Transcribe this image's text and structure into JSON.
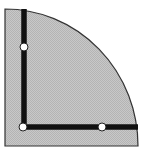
{
  "diagram": {
    "shape": "quarter-circle",
    "colors": {
      "fill": "#c4c4c4",
      "outline": "#333333",
      "bar": "#111111",
      "node_fill": "#ffffff",
      "background": "#ffffff"
    },
    "bars": [
      {
        "name": "vertical-bar",
        "x1": 24,
        "y1": 9,
        "x2": 24,
        "y2": 127
      },
      {
        "name": "horizontal-bar",
        "x1": 24,
        "y1": 127,
        "x2": 138,
        "y2": 127
      }
    ],
    "nodes": [
      {
        "name": "top-node",
        "cx": 24,
        "cy": 47
      },
      {
        "name": "corner-node",
        "cx": 23,
        "cy": 127
      },
      {
        "name": "right-node",
        "cx": 102,
        "cy": 127
      }
    ]
  }
}
